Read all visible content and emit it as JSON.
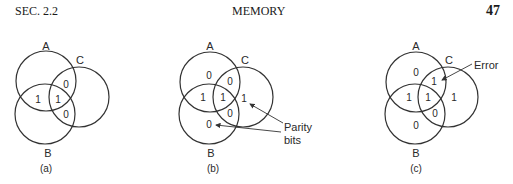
{
  "header": {
    "section": "SEC.  2.2",
    "title": "MEMORY",
    "page_number": "47"
  },
  "diagrams": [
    {
      "caption": "(a)",
      "circles": {
        "A": "A",
        "B": "B",
        "C": "C"
      },
      "values": {
        "ac": "0",
        "ab": "1",
        "abc": "1",
        "bc": "0"
      }
    },
    {
      "caption": "(b)",
      "circles": {
        "A": "A",
        "B": "B",
        "C": "C"
      },
      "values": {
        "a": "0",
        "ac": "0",
        "ab": "1",
        "abc": "1",
        "c": "1",
        "bc": "0",
        "b": "0"
      },
      "annotation": {
        "line1": "Parity",
        "line2": "bits"
      }
    },
    {
      "caption": "(c)",
      "circles": {
        "A": "A",
        "B": "B",
        "C": "C"
      },
      "values": {
        "a": "0",
        "ac": "1",
        "ab": "1",
        "abc": "1",
        "c": "1",
        "bc": "0",
        "b": "0"
      },
      "annotation": {
        "line1": "Error"
      }
    }
  ],
  "colors": {
    "line": "#333333",
    "text": "#2a2a2a"
  }
}
